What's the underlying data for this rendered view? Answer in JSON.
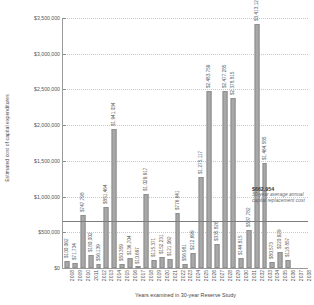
{
  "chart_data": {
    "type": "bar",
    "title": "",
    "xlabel": "Years examined in 30-year Reserve Study",
    "ylabel": "Estimated cost of capital expenditures",
    "ylim": [
      0,
      3500000
    ],
    "ytick_labels": [
      "$3,500,000",
      "$3,000,000",
      "$2,500,000",
      "$2,000,000",
      "$1,500,000",
      "$1,000,000",
      "$500,000",
      "$0"
    ],
    "ytick_values": [
      3500000,
      3000000,
      2500000,
      2000000,
      1500000,
      1000000,
      500000,
      0
    ],
    "grid": true,
    "legend": "none",
    "categories": [
      "2008",
      "2009",
      "2010",
      "2011",
      "2012",
      "2013",
      "2014",
      "2015",
      "2016",
      "2017",
      "2018",
      "2019",
      "2020",
      "2021",
      "2022",
      "2023",
      "2024",
      "2025",
      "2026",
      "2027",
      "2028",
      "2029",
      "2030",
      "2031",
      "2032",
      "2033",
      "2034",
      "2035",
      "2036",
      "2037",
      "2038"
    ],
    "values": [
      100062,
      71734,
      747798,
      180002,
      56139,
      851464,
      1941034,
      50359,
      136704,
      10697,
      1029917,
      115371,
      152231,
      121062,
      776641,
      56981,
      212699,
      1275117,
      2483759,
      335826,
      2477285,
      2378815,
      144815,
      537782,
      3413123,
      1464585,
      80573,
      220929,
      118857,
      0,
      0
    ],
    "value_labels": [
      "$100,062",
      "$71,734",
      "$747,798",
      "$180,002",
      "$56,139",
      "$851,464",
      "$1,941,034",
      "$50,359",
      "$136,704",
      "$10,697",
      "$1,029,917",
      "$115,371",
      "$152,231",
      "$121,062",
      "$776,641",
      "$56,981",
      "$212,699",
      "$1,275,117",
      "$2,483,759",
      "$335,826",
      "$2,477,285",
      "$2,378,815",
      "$144,815",
      "$537,782",
      "$3,413,123",
      "$1,464,585",
      "$80,573",
      "$220,929",
      "$118,857",
      "",
      ""
    ],
    "annotations": [
      {
        "name": "30-year-average-line",
        "value": 662954,
        "value_label": "$662,954",
        "description": "30-year average annual capital replacement cost"
      }
    ]
  },
  "colors": {
    "bar_fill": "#a8a8a8",
    "bar_stroke": "#8f8f8f",
    "axis": "#9a9a9a",
    "grid": "#c9c9c9",
    "average_line": "#7d7d7d",
    "text": "#555555",
    "annotation_value": "#3a3a3a",
    "annotation_desc": "#6a6a6a"
  }
}
